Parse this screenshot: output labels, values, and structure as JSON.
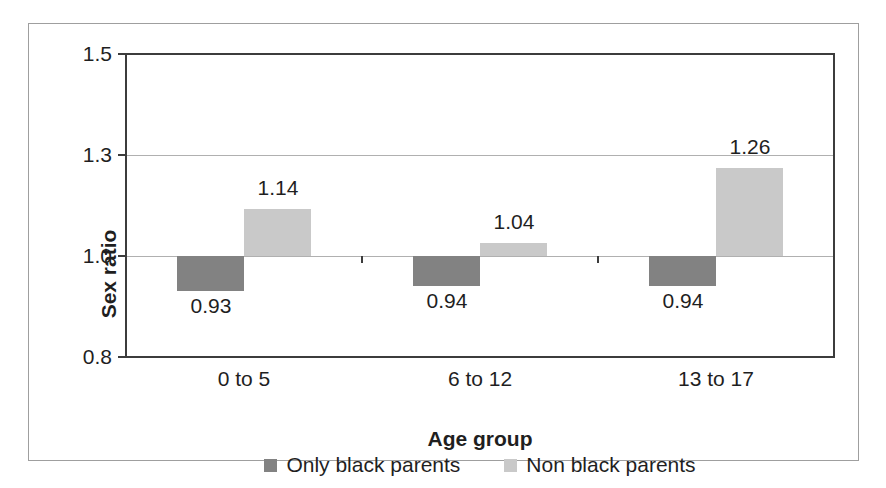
{
  "chart_data": {
    "type": "bar",
    "title": "",
    "xlabel": "Age group",
    "ylabel": "Sex ratio",
    "categories": [
      "0 to 5",
      "6 to 12",
      "13 to 17"
    ],
    "series": [
      {
        "name": "Only black parents",
        "color": "#828282",
        "values": [
          0.93,
          0.94,
          0.94
        ],
        "labels": [
          "0.93",
          "0.94",
          "0.94"
        ]
      },
      {
        "name": "Non black parents",
        "color": "#c9c9c9",
        "values": [
          1.14,
          1.04,
          1.26
        ],
        "labels": [
          "1.14",
          "1.04",
          "1.26"
        ]
      }
    ],
    "baseline": 1.0,
    "ytick_values": [
      0.8,
      1.0,
      1.3,
      1.5
    ],
    "ytick_labels": [
      "0.8",
      "1.0",
      "1.3",
      "1.5"
    ],
    "ytick_spacing": "equal",
    "grid": "horizontal-inner",
    "legend_position": "bottom",
    "bar_label_position": "outside-end"
  }
}
